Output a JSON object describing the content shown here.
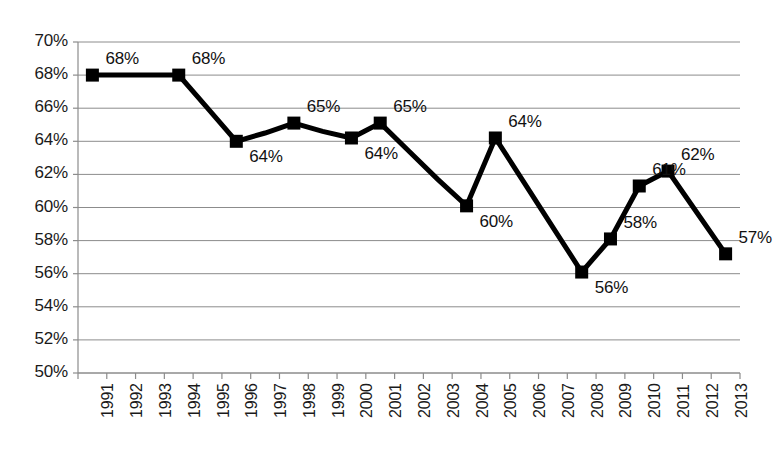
{
  "chart_data": {
    "type": "line",
    "title": "",
    "subtitle": "",
    "xlabel": "",
    "ylabel": "",
    "grid": true,
    "legend_position": "none",
    "ylim": [
      50,
      70
    ],
    "ytick_step": 2,
    "ytick_labels": [
      "70%",
      "68%",
      "66%",
      "64%",
      "62%",
      "60%",
      "58%",
      "56%",
      "54%",
      "52%",
      "50%"
    ],
    "ytick_values": [
      70,
      68,
      66,
      64,
      62,
      60,
      58,
      56,
      54,
      52,
      50
    ],
    "categories": [
      "1991",
      "1992",
      "1993",
      "1994",
      "1995",
      "1996",
      "1997",
      "1998",
      "1999",
      "2000",
      "2001",
      "2002",
      "2003",
      "2004",
      "2005",
      "2006",
      "2007",
      "2008",
      "2009",
      "2010",
      "2011",
      "2012",
      "2013"
    ],
    "values": [
      68.0,
      68.0,
      68.0,
      68.0,
      66.0,
      64.0,
      64.5,
      65.1,
      64.6,
      64.2,
      65.1,
      63.4,
      61.7,
      60.1,
      64.2,
      61.5,
      58.8,
      56.1,
      58.1,
      61.3,
      62.2,
      59.7,
      57.2
    ],
    "series": [
      {
        "name": "Rate",
        "color": "#000000",
        "line_width": 5,
        "marker": "square",
        "marker_size": 13,
        "values": [
          68.0,
          68.0,
          68.0,
          68.0,
          66.0,
          64.0,
          64.5,
          65.1,
          64.6,
          64.2,
          65.1,
          63.4,
          61.7,
          60.1,
          64.2,
          61.5,
          58.8,
          56.1,
          58.1,
          61.3,
          62.2,
          59.7,
          57.2
        ]
      }
    ],
    "markers": [
      {
        "category": "1991",
        "value": 68.0,
        "label": "68%",
        "label_position": "right-above"
      },
      {
        "category": "1994",
        "value": 68.0,
        "label": "68%",
        "label_position": "right-above"
      },
      {
        "category": "1996",
        "value": 64.0,
        "label": "64%",
        "label_position": "right-below"
      },
      {
        "category": "1998",
        "value": 65.1,
        "label": "65%",
        "label_position": "right-above"
      },
      {
        "category": "2000",
        "value": 64.2,
        "label": "64%",
        "label_position": "right-below"
      },
      {
        "category": "2001",
        "value": 65.1,
        "label": "65%",
        "label_position": "right-above"
      },
      {
        "category": "2004",
        "value": 60.1,
        "label": "60%",
        "label_position": "right-below"
      },
      {
        "category": "2005",
        "value": 64.2,
        "label": "64%",
        "label_position": "right-above"
      },
      {
        "category": "2008",
        "value": 56.1,
        "label": "56%",
        "label_position": "right-below"
      },
      {
        "category": "2009",
        "value": 58.1,
        "label": "58%",
        "label_position": "right-above"
      },
      {
        "category": "2010",
        "value": 61.3,
        "label": "61%",
        "label_position": "right-above"
      },
      {
        "category": "2011",
        "value": 62.2,
        "label": "62%",
        "label_position": "right-above"
      },
      {
        "category": "2013",
        "value": 57.2,
        "label": "57%",
        "label_position": "right-above"
      }
    ],
    "colors": {
      "line": "#000000",
      "marker": "#000000",
      "gridline": "#8c8c8c",
      "axis": "#8c8c8c",
      "background": "#ffffff",
      "text": "#1a1a1a"
    }
  }
}
